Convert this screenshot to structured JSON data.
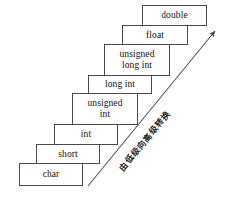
{
  "diagram": {
    "background_color": "#ffffff",
    "box_border_color": "#4a4a4a",
    "text_color": "#111111",
    "arrow_color": "#555555",
    "steps": [
      {
        "id": "char",
        "label_line1": "char",
        "label_line2": "",
        "x": 19,
        "y": 163,
        "w": 64,
        "h": 23
      },
      {
        "id": "short",
        "label_line1": "short",
        "label_line2": "",
        "x": 36,
        "y": 144,
        "w": 64,
        "h": 20
      },
      {
        "id": "int",
        "label_line1": "int",
        "label_line2": "",
        "x": 54,
        "y": 124,
        "w": 64,
        "h": 21
      },
      {
        "id": "unsigned-int",
        "label_line1": "unsigned",
        "label_line2": "int",
        "x": 72,
        "y": 93,
        "w": 66,
        "h": 32
      },
      {
        "id": "long-int",
        "label_line1": "long int",
        "label_line2": "",
        "x": 88,
        "y": 75,
        "w": 64,
        "h": 19
      },
      {
        "id": "unsigned-long-int",
        "label_line1": "unsigned",
        "label_line2": "long int",
        "x": 104,
        "y": 44,
        "w": 66,
        "h": 32
      },
      {
        "id": "float",
        "label_line1": "float",
        "label_line2": "",
        "x": 122,
        "y": 25,
        "w": 66,
        "h": 20
      },
      {
        "id": "double",
        "label_line1": "double",
        "label_line2": "",
        "x": 142,
        "y": 5,
        "w": 65,
        "h": 21
      }
    ],
    "arrow": {
      "caption": "由低级向高级转换",
      "start_x": 88,
      "start_y": 186,
      "end_x": 218,
      "end_y": 28
    }
  }
}
